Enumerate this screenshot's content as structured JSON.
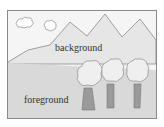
{
  "labels": {
    "background": "background",
    "foreground": "foreground"
  },
  "colors": {
    "sky": "#f4f4f4",
    "mountains": "#e6e6e6",
    "ground": "#d9d9d9",
    "trunk": "#9a9a9a",
    "canopy": "#ececec",
    "outline": "#888888"
  }
}
